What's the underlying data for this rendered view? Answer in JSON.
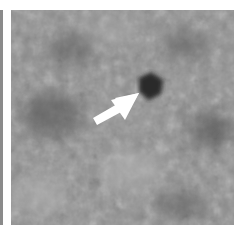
{
  "figure": {
    "type": "grayscale medical image patch",
    "annotation": "white arrow pointing to dark lesion",
    "colors": {
      "background": "#ffffff",
      "tissue_mid": "#8e8e8e",
      "tissue_dark": "#5a5a5a",
      "tissue_light": "#b0b0b0",
      "lesion": "#2a2a2a",
      "arrow": "#ffffff"
    },
    "lesion": {
      "cx": 138,
      "cy": 75,
      "r": 12
    },
    "arrow": {
      "tail_x": 92,
      "tail_y": 115,
      "head_x": 128,
      "head_y": 83
    }
  }
}
